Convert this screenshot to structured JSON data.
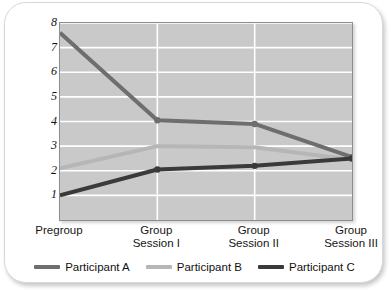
{
  "chart_data": {
    "type": "line",
    "title": "",
    "subtitle": "",
    "xlabel": "",
    "ylabel": "Inches of perceived movement",
    "categories": [
      "Pregroup",
      "Group Session I",
      "Group Session II",
      "Group Session III"
    ],
    "category_lines": [
      [
        "Pregroup"
      ],
      [
        "Group",
        "Session I"
      ],
      [
        "Group",
        "Session II"
      ],
      [
        "Group",
        "Session III"
      ]
    ],
    "ylim": [
      0,
      8
    ],
    "yticks": [
      1,
      2,
      3,
      4,
      5,
      6,
      7,
      8
    ],
    "ytick_labels": [
      "1",
      "2",
      "3",
      "4",
      "5",
      "6",
      "7",
      "8"
    ],
    "grid": true,
    "grid_axis": "y",
    "legend_position": "bottom",
    "series": [
      {
        "name": "Participant A",
        "color": "#6e6e6e",
        "markers": true,
        "values": [
          7.6,
          4.05,
          3.9,
          2.55
        ]
      },
      {
        "name": "Participant B",
        "color": "#b6b6b6",
        "markers": false,
        "values": [
          2.1,
          3.0,
          2.95,
          2.45
        ]
      },
      {
        "name": "Participant C",
        "color": "#3a3a3a",
        "markers": true,
        "values": [
          1.0,
          2.05,
          2.2,
          2.5
        ]
      }
    ]
  },
  "colors": {
    "plot_background": "#c9c9c9",
    "gridline": "#ffffff",
    "axis_border": "#8e8e8e",
    "card_background": "#ffffff",
    "participant_a": "#6e6e6e",
    "participant_b": "#b6b6b6",
    "participant_c": "#3a3a3a"
  }
}
